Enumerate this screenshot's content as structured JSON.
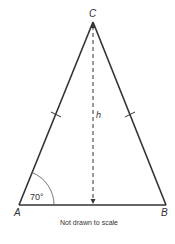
{
  "diagram": {
    "type": "isosceles-triangle",
    "vertices": {
      "A": {
        "label": "A",
        "x": 19,
        "y": 205
      },
      "B": {
        "label": "B",
        "x": 166,
        "y": 205
      },
      "C": {
        "label": "C",
        "x": 93,
        "y": 21
      }
    },
    "height_label": "h",
    "angle_label": "70°",
    "caption": "Not drawn to scale",
    "colors": {
      "stroke": "#333333",
      "text": "#333333"
    }
  }
}
